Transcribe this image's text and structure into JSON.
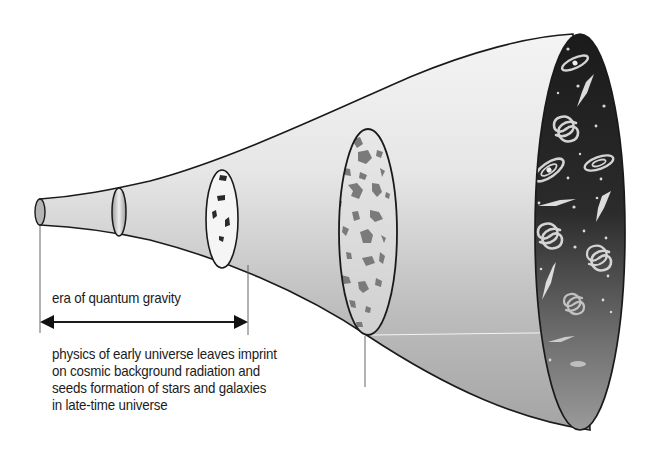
{
  "diagram": {
    "era_label": "era of quantum gravity",
    "caption_lines": [
      "physics of early universe leaves imprint",
      "on cosmic background radiation and",
      "seeds formation of stars and galaxies",
      "in late-time universe"
    ],
    "cross_sections": [
      {
        "name": "initial",
        "content": "plain"
      },
      {
        "name": "quantum-era-end",
        "content": "plain"
      },
      {
        "name": "early-fluctuations",
        "content": "few dark blotches"
      },
      {
        "name": "cosmic-background",
        "content": "many blotches"
      },
      {
        "name": "late-time-universe",
        "content": "galaxies and stars"
      }
    ],
    "colors": {
      "outline": "#1a1a1a",
      "funnel_light": "#efefef",
      "funnel_dark": "#a8a8a8",
      "space": "#1e1e1e",
      "blotch": "#7a7a7a"
    }
  }
}
